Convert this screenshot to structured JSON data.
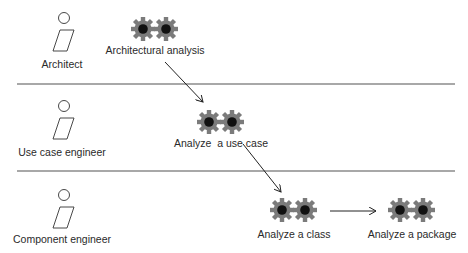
{
  "diagram": {
    "type": "workflow-swimlanes",
    "lanes": [
      {
        "id": "architect",
        "worker": "Architect",
        "activities": [
          "Architectural analysis"
        ]
      },
      {
        "id": "use-case-engineer",
        "worker": "Use case engineer",
        "activities": [
          "Analyze  a use case"
        ]
      },
      {
        "id": "component-engineer",
        "worker": "Component engineer",
        "activities": [
          "Analyze a class",
          "Analyze a package"
        ]
      }
    ],
    "workers": {
      "architect": "Architect",
      "use_case_engineer": "Use case engineer",
      "component_engineer": "Component engineer"
    },
    "activities": {
      "architectural_analysis": "Architectural analysis",
      "analyze_use_case": "Analyze  a use case",
      "analyze_class": "Analyze a class",
      "analyze_package": "Analyze a package"
    },
    "edges": [
      {
        "from": "Architectural analysis",
        "to": "Analyze  a use case"
      },
      {
        "from": "Analyze  a use case",
        "to": "Analyze a class"
      },
      {
        "from": "Analyze a class",
        "to": "Analyze a package"
      }
    ],
    "colors": {
      "gear": "#7a7a7a",
      "gear_hub": "#111111",
      "lane_separator": "#a8a8a8",
      "line": "#222222"
    }
  }
}
